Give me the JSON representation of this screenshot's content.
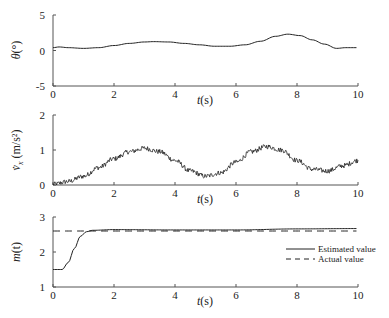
{
  "chart_data": [
    {
      "type": "line",
      "title": "",
      "xlabel": "t(s)",
      "ylabel": "θ(°)",
      "xlim": [
        0,
        10
      ],
      "ylim": [
        -5,
        5
      ],
      "xticks": [
        "0",
        "2",
        "4",
        "6",
        "8",
        "10"
      ],
      "yticks": [
        "-5",
        "0",
        "5"
      ],
      "grid": false,
      "series": [
        {
          "name": "theta",
          "x": [
            0,
            0.2,
            0.5,
            1.0,
            1.5,
            2.0,
            2.5,
            3.0,
            3.3,
            3.8,
            4.3,
            4.8,
            5.3,
            5.8,
            6.3,
            6.8,
            7.3,
            7.7,
            8.1,
            8.5,
            8.9,
            9.3,
            9.6,
            10.0
          ],
          "values": [
            0.4,
            0.5,
            0.4,
            0.3,
            0.4,
            0.7,
            1.0,
            1.2,
            1.25,
            1.2,
            1.0,
            0.8,
            0.6,
            0.6,
            0.8,
            1.3,
            2.0,
            2.3,
            2.1,
            1.5,
            0.9,
            0.3,
            0.4,
            0.4
          ]
        }
      ]
    },
    {
      "type": "line",
      "title": "",
      "xlabel": "t(s)",
      "ylabel": "v̇x (m/s²)",
      "xlim": [
        0,
        10
      ],
      "ylim": [
        0,
        2
      ],
      "xticks": [
        "0",
        "2",
        "4",
        "6",
        "8",
        "10"
      ],
      "yticks": [
        "0",
        "1",
        "2"
      ],
      "grid": false,
      "series": [
        {
          "name": "acceleration (noisy)",
          "x": [
            0,
            0.5,
            1.0,
            1.5,
            2.0,
            2.5,
            3.0,
            3.5,
            4.0,
            4.5,
            5.0,
            5.5,
            6.0,
            6.5,
            7.0,
            7.5,
            8.0,
            8.5,
            9.0,
            9.5,
            10.0
          ],
          "values": [
            0.02,
            0.1,
            0.25,
            0.5,
            0.75,
            0.95,
            1.05,
            0.95,
            0.7,
            0.4,
            0.25,
            0.35,
            0.65,
            0.95,
            1.1,
            1.0,
            0.7,
            0.45,
            0.4,
            0.55,
            0.7
          ]
        }
      ]
    },
    {
      "type": "line",
      "title": "",
      "xlabel": "t(s)",
      "ylabel": "m(t)",
      "xlim": [
        0,
        10
      ],
      "ylim": [
        1,
        3
      ],
      "xticks": [
        "0",
        "2",
        "4",
        "6",
        "8",
        "10"
      ],
      "yticks": [
        "1",
        "2",
        "3"
      ],
      "grid": false,
      "legend_position": "right-middle",
      "series": [
        {
          "name": "Estimated value",
          "style": "solid",
          "x": [
            0,
            0.3,
            0.5,
            0.7,
            0.9,
            1.1,
            1.3,
            2.0,
            4.0,
            6.0,
            8.0,
            10.0
          ],
          "values": [
            1.5,
            1.5,
            1.7,
            2.1,
            2.45,
            2.58,
            2.62,
            2.64,
            2.63,
            2.63,
            2.66,
            2.67
          ]
        },
        {
          "name": "Actual value",
          "style": "dashed",
          "x": [
            0,
            10
          ],
          "values": [
            2.6,
            2.6
          ]
        }
      ]
    }
  ],
  "labels": {
    "plot1_ylabel": "θ(°)",
    "plot2_ylabel_main": "v",
    "plot2_ylabel_sub": "x",
    "plot2_ylabel_unit": "(m/s²)",
    "plot3_ylabel": "m(t)",
    "xlabel": "t(s)",
    "legend_estimated": "Estimated value",
    "legend_actual": "Actual value"
  }
}
